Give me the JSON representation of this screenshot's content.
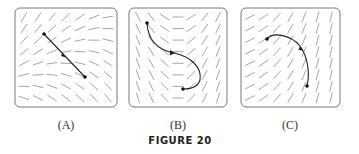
{
  "figure": {
    "caption": "FIGURE 20",
    "panels": [
      {
        "id": "A",
        "label": "(A)",
        "description": "slope field with straight-line solution segment"
      },
      {
        "id": "B",
        "label": "(B)",
        "description": "slope field with S-shaped solution curve"
      },
      {
        "id": "C",
        "label": "(C)",
        "description": "slope field with arc solution curve"
      }
    ]
  },
  "colors": {
    "border": "#777777",
    "field": "#9a9a9a",
    "curve": "#222222"
  }
}
